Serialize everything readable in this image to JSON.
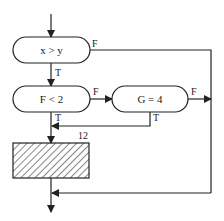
{
  "diagram": {
    "type": "flowchart",
    "nodes": [
      {
        "id": "cond1",
        "shape": "terminal",
        "label": "x > y"
      },
      {
        "id": "cond2",
        "shape": "terminal",
        "label": "F < 2"
      },
      {
        "id": "cond3",
        "shape": "terminal",
        "label": "G = 4"
      },
      {
        "id": "block12",
        "shape": "hatched-rect",
        "label": "12"
      }
    ],
    "edge_labels": {
      "cond1_false": "F",
      "cond1_true": "T",
      "cond2_false": "F",
      "cond2_true": "T",
      "cond3_false": "F",
      "cond3_true": "T"
    },
    "colors": {
      "stroke": "#222222",
      "background": "#ffffff"
    }
  }
}
